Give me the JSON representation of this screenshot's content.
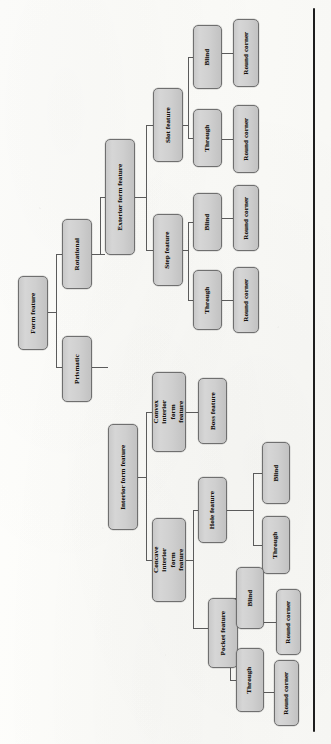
{
  "diagram": {
    "type": "hierarchical-tree",
    "orientation": "rotated-90-ccw",
    "colors": {
      "node_fill": "#d0d0d0",
      "node_border": "#6f6f6f",
      "connector": "#5b5b5b",
      "page_background": "#fbfbf8",
      "spine": "#111111"
    },
    "root": "Form feature",
    "nodes": [
      {
        "id": "form-feature",
        "label": "Form feature",
        "level": 0,
        "x": 18,
        "y": 276,
        "w": 30,
        "h": 74,
        "two_line": false
      },
      {
        "id": "rotational",
        "label": "Rotational",
        "level": 1,
        "x": 62,
        "y": 219,
        "w": 30,
        "h": 70,
        "two_line": false
      },
      {
        "id": "prismatic",
        "label": "Prismatic",
        "level": 1,
        "x": 62,
        "y": 336,
        "w": 30,
        "h": 66,
        "two_line": false
      },
      {
        "id": "exterior-form-feature",
        "label": "Exterior form feature",
        "level": 2,
        "x": 105,
        "y": 139,
        "w": 30,
        "h": 116,
        "two_line": false
      },
      {
        "id": "interior-form-feature",
        "label": "Interior form feature",
        "level": 2,
        "x": 108,
        "y": 424,
        "w": 30,
        "h": 106,
        "two_line": false
      },
      {
        "id": "slot-feature",
        "label": "Slot feature",
        "level": 3,
        "x": 153,
        "y": 88,
        "w": 30,
        "h": 74,
        "two_line": false
      },
      {
        "id": "step-feature",
        "label": "Step feature",
        "level": 3,
        "x": 153,
        "y": 214,
        "w": 30,
        "h": 72,
        "two_line": false
      },
      {
        "id": "convex-interior",
        "label": "Convex interior form feature",
        "level": 3,
        "x": 152,
        "y": 372,
        "w": 34,
        "h": 80,
        "two_line": true
      },
      {
        "id": "concave-interior",
        "label": "Concave interior form feature",
        "level": 3,
        "x": 152,
        "y": 518,
        "w": 34,
        "h": 84,
        "two_line": true
      },
      {
        "id": "slot-blind",
        "label": "Blind",
        "level": 4,
        "x": 193,
        "y": 25,
        "w": 29,
        "h": 64,
        "two_line": false
      },
      {
        "id": "slot-through",
        "label": "Through",
        "level": 4,
        "x": 193,
        "y": 109,
        "w": 29,
        "h": 58,
        "two_line": false
      },
      {
        "id": "step-blind",
        "label": "Blind",
        "level": 4,
        "x": 193,
        "y": 193,
        "w": 29,
        "h": 58,
        "two_line": false
      },
      {
        "id": "step-through",
        "label": "Through",
        "level": 4,
        "x": 193,
        "y": 270,
        "w": 29,
        "h": 60,
        "two_line": false
      },
      {
        "id": "boss-feature",
        "label": "Boss feature",
        "level": 4,
        "x": 198,
        "y": 378,
        "w": 29,
        "h": 66,
        "two_line": false
      },
      {
        "id": "hole-feature",
        "label": "Hole feature",
        "level": 4,
        "x": 198,
        "y": 477,
        "w": 29,
        "h": 66,
        "two_line": false
      },
      {
        "id": "pocket-feature",
        "label": "Pocket feature",
        "level": 4,
        "x": 208,
        "y": 598,
        "w": 30,
        "h": 70,
        "two_line": false
      },
      {
        "id": "slot-blind-rc",
        "label": "Round corner",
        "level": 5,
        "x": 233,
        "y": 19,
        "w": 26,
        "h": 68,
        "two_line": false
      },
      {
        "id": "slot-through-rc",
        "label": "Round corner",
        "level": 5,
        "x": 233,
        "y": 105,
        "w": 26,
        "h": 68,
        "two_line": false
      },
      {
        "id": "step-blind-rc",
        "label": "Round corner",
        "level": 5,
        "x": 233,
        "y": 185,
        "w": 26,
        "h": 66,
        "two_line": false
      },
      {
        "id": "step-through-rc",
        "label": "Round corner",
        "level": 5,
        "x": 233,
        "y": 267,
        "w": 26,
        "h": 66,
        "two_line": false
      },
      {
        "id": "hole-blind",
        "label": "Blind",
        "level": 5,
        "x": 262,
        "y": 442,
        "w": 28,
        "h": 62,
        "two_line": false
      },
      {
        "id": "hole-through",
        "label": "Through",
        "level": 5,
        "x": 262,
        "y": 516,
        "w": 28,
        "h": 58,
        "two_line": false
      },
      {
        "id": "pocket-blind",
        "label": "Blind",
        "level": 5,
        "x": 236,
        "y": 567,
        "w": 28,
        "h": 62,
        "two_line": false
      },
      {
        "id": "pocket-through",
        "label": "Through",
        "level": 5,
        "x": 236,
        "y": 648,
        "w": 28,
        "h": 64,
        "two_line": false
      },
      {
        "id": "pocket-blind-rc",
        "label": "Round corner",
        "level": 6,
        "x": 276,
        "y": 589,
        "w": 25,
        "h": 66,
        "two_line": false
      },
      {
        "id": "pocket-through-rc",
        "label": "Round corner",
        "level": 6,
        "x": 274,
        "y": 660,
        "w": 25,
        "h": 66,
        "two_line": false
      }
    ],
    "edges": [
      {
        "from": "form-feature",
        "to": [
          "rotational",
          "prismatic"
        ]
      },
      {
        "from": "rotational",
        "to": [
          "exterior-form-feature"
        ]
      },
      {
        "from": "prismatic",
        "to": [
          "interior-form-feature"
        ]
      },
      {
        "from": "exterior-form-feature",
        "to": [
          "slot-feature",
          "step-feature"
        ]
      },
      {
        "from": "interior-form-feature",
        "to": [
          "convex-interior",
          "concave-interior"
        ]
      },
      {
        "from": "slot-feature",
        "to": [
          "slot-blind",
          "slot-through"
        ]
      },
      {
        "from": "step-feature",
        "to": [
          "step-blind",
          "step-through"
        ]
      },
      {
        "from": "convex-interior",
        "to": [
          "boss-feature"
        ]
      },
      {
        "from": "concave-interior",
        "to": [
          "hole-feature",
          "pocket-feature"
        ]
      },
      {
        "from": "slot-blind",
        "to": [
          "slot-blind-rc"
        ]
      },
      {
        "from": "slot-through",
        "to": [
          "slot-through-rc"
        ]
      },
      {
        "from": "step-blind",
        "to": [
          "step-blind-rc"
        ]
      },
      {
        "from": "step-through",
        "to": [
          "step-through-rc"
        ]
      },
      {
        "from": "hole-feature",
        "to": [
          "hole-blind",
          "hole-through"
        ]
      },
      {
        "from": "pocket-feature",
        "to": [
          "pocket-blind",
          "pocket-through"
        ]
      },
      {
        "from": "pocket-blind",
        "to": [
          "pocket-blind-rc"
        ]
      },
      {
        "from": "pocket-through",
        "to": [
          "pocket-through-rc"
        ]
      }
    ],
    "connectors": [
      {
        "o": "v",
        "x": 56,
        "y": 254,
        "len": 113
      },
      {
        "o": "h",
        "x": 48,
        "y": 312,
        "len": 8
      },
      {
        "o": "h",
        "x": 56,
        "y": 254,
        "len": 6
      },
      {
        "o": "h",
        "x": 56,
        "y": 367,
        "len": 6
      },
      {
        "o": "h",
        "x": 92,
        "y": 254,
        "len": 13
      },
      {
        "o": "h",
        "x": 92,
        "y": 367,
        "len": 16
      },
      {
        "o": "v",
        "x": 100,
        "y": 197,
        "len": 57
      },
      {
        "o": "h",
        "x": 100,
        "y": 197,
        "len": 5
      },
      {
        "o": "v",
        "x": 146,
        "y": 125,
        "len": 125
      },
      {
        "o": "h",
        "x": 135,
        "y": 197,
        "len": 11
      },
      {
        "o": "h",
        "x": 146,
        "y": 125,
        "len": 7
      },
      {
        "o": "h",
        "x": 146,
        "y": 250,
        "len": 7
      },
      {
        "o": "v",
        "x": 188,
        "y": 57,
        "len": 81
      },
      {
        "o": "h",
        "x": 183,
        "y": 125,
        "len": 5
      },
      {
        "o": "h",
        "x": 188,
        "y": 57,
        "len": 5
      },
      {
        "o": "h",
        "x": 188,
        "y": 138,
        "len": 5
      },
      {
        "o": "v",
        "x": 188,
        "y": 222,
        "len": 78
      },
      {
        "o": "h",
        "x": 183,
        "y": 250,
        "len": 5
      },
      {
        "o": "h",
        "x": 188,
        "y": 222,
        "len": 5
      },
      {
        "o": "h",
        "x": 188,
        "y": 300,
        "len": 5
      },
      {
        "o": "h",
        "x": 222,
        "y": 53,
        "len": 11
      },
      {
        "o": "h",
        "x": 222,
        "y": 139,
        "len": 11
      },
      {
        "o": "h",
        "x": 222,
        "y": 218,
        "len": 11
      },
      {
        "o": "h",
        "x": 222,
        "y": 300,
        "len": 11
      },
      {
        "o": "v",
        "x": 146,
        "y": 412,
        "len": 148
      },
      {
        "o": "h",
        "x": 138,
        "y": 477,
        "len": 8
      },
      {
        "o": "h",
        "x": 146,
        "y": 412,
        "len": 6
      },
      {
        "o": "h",
        "x": 146,
        "y": 560,
        "len": 6
      },
      {
        "o": "h",
        "x": 186,
        "y": 412,
        "len": 12
      },
      {
        "o": "v",
        "x": 193,
        "y": 510,
        "len": 118
      },
      {
        "o": "h",
        "x": 186,
        "y": 560,
        "len": 7
      },
      {
        "o": "h",
        "x": 193,
        "y": 510,
        "len": 5
      },
      {
        "o": "h",
        "x": 193,
        "y": 628,
        "len": 15
      },
      {
        "o": "v",
        "x": 253,
        "y": 473,
        "len": 72
      },
      {
        "o": "h",
        "x": 227,
        "y": 510,
        "len": 26
      },
      {
        "o": "h",
        "x": 253,
        "y": 473,
        "len": 9
      },
      {
        "o": "h",
        "x": 253,
        "y": 545,
        "len": 9
      },
      {
        "o": "v",
        "x": 230,
        "y": 598,
        "len": 82
      },
      {
        "o": "h",
        "x": 227,
        "y": 628,
        "len": 3
      },
      {
        "o": "h",
        "x": 230,
        "y": 598,
        "len": 6
      },
      {
        "o": "h",
        "x": 230,
        "y": 680,
        "len": 6
      },
      {
        "o": "h",
        "x": 264,
        "y": 622,
        "len": 12
      },
      {
        "o": "h",
        "x": 264,
        "y": 692,
        "len": 10
      }
    ],
    "spine": {
      "x": 313,
      "y": 8,
      "w": 2,
      "h": 724
    }
  }
}
